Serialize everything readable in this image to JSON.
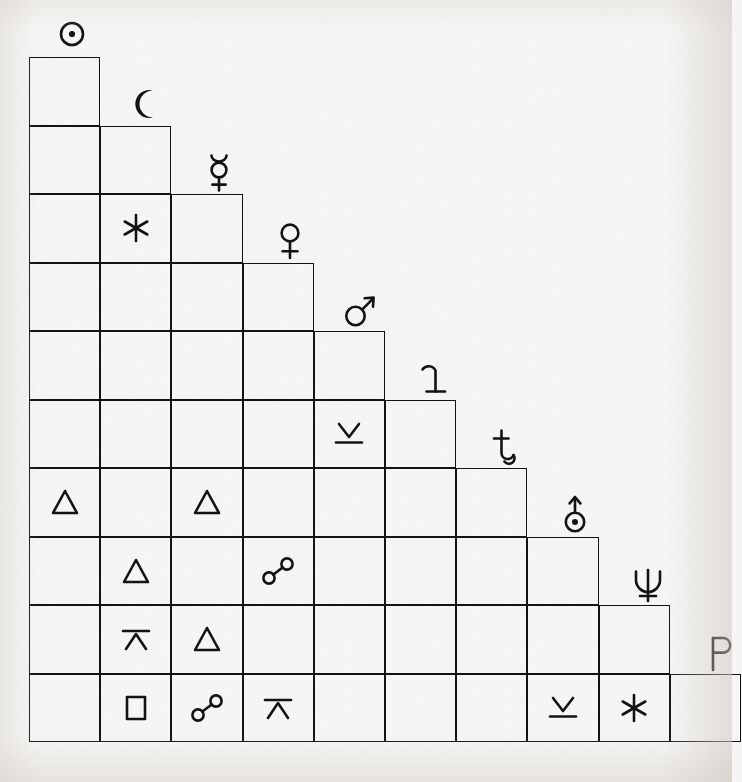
{
  "document": {
    "kind": "astrological-aspectarian",
    "title": "Aspect Grid",
    "background_color": "#f6f5f3",
    "ink_color": "#15130f"
  },
  "grid": {
    "origin_x": 29,
    "origin_y": 57,
    "cell_width": 71.2,
    "cell_height": 68.5,
    "rows": 10,
    "shape": "lower-left-triangular-staircase"
  },
  "planets": [
    {
      "index": 0,
      "name": "Sun",
      "symbol": "☉",
      "icon": "sun-icon",
      "label": "Sun"
    },
    {
      "index": 1,
      "name": "Moon",
      "symbol": "☾",
      "icon": "moon-icon",
      "label": "Moon"
    },
    {
      "index": 2,
      "name": "Mercury",
      "symbol": "☿",
      "icon": "mercury-icon",
      "label": "Mercury"
    },
    {
      "index": 3,
      "name": "Venus",
      "symbol": "♀",
      "icon": "venus-icon",
      "label": "Venus"
    },
    {
      "index": 4,
      "name": "Mars",
      "symbol": "♂",
      "icon": "mars-icon",
      "label": "Mars"
    },
    {
      "index": 5,
      "name": "Jupiter",
      "symbol": "♃",
      "icon": "jupiter-icon",
      "label": "Jupiter"
    },
    {
      "index": 6,
      "name": "Saturn",
      "symbol": "♄",
      "icon": "saturn-icon",
      "label": "Saturn"
    },
    {
      "index": 7,
      "name": "Uranus",
      "symbol": "⛢",
      "icon": "uranus-icon",
      "label": "Uranus"
    },
    {
      "index": 8,
      "name": "Neptune",
      "symbol": "♆",
      "icon": "neptune-icon",
      "label": "Neptune"
    },
    {
      "index": 9,
      "name": "Pluto",
      "symbol": "♇",
      "icon": "pluto-icon",
      "label": "Pluto"
    }
  ],
  "aspect_types": {
    "sextile": {
      "symbol": "✶",
      "icon": "sextile-icon",
      "label": "Sextile",
      "angle": 60
    },
    "trine": {
      "symbol": "△",
      "icon": "trine-icon",
      "label": "Trine",
      "angle": 120
    },
    "square": {
      "symbol": "□",
      "icon": "square-icon",
      "label": "Square",
      "angle": 90
    },
    "opposition": {
      "symbol": "☍",
      "icon": "opposition-icon",
      "label": "Opposition",
      "angle": 180
    },
    "quincunx": {
      "symbol": "⊻",
      "icon": "quincunx-icon",
      "label": "Quincunx",
      "angle": 150
    },
    "quincunx_inv": {
      "symbol": "⊼",
      "icon": "quincunx-inverted-icon",
      "label": "Quincunx (inverted)",
      "angle": 150
    }
  },
  "aspects": [
    {
      "row": 2,
      "col": 1,
      "row_planet": "Mercury",
      "col_planet": "Moon",
      "type": "sextile"
    },
    {
      "row": 5,
      "col": 4,
      "row_planet": "Jupiter",
      "col_planet": "Mars",
      "type": "quincunx"
    },
    {
      "row": 6,
      "col": 0,
      "row_planet": "Saturn",
      "col_planet": "Sun",
      "type": "trine"
    },
    {
      "row": 6,
      "col": 2,
      "row_planet": "Saturn",
      "col_planet": "Mercury",
      "type": "trine"
    },
    {
      "row": 7,
      "col": 1,
      "row_planet": "Uranus",
      "col_planet": "Moon",
      "type": "trine"
    },
    {
      "row": 7,
      "col": 3,
      "row_planet": "Uranus",
      "col_planet": "Venus",
      "type": "opposition"
    },
    {
      "row": 8,
      "col": 1,
      "row_planet": "Neptune",
      "col_planet": "Moon",
      "type": "quincunx_inv"
    },
    {
      "row": 8,
      "col": 2,
      "row_planet": "Neptune",
      "col_planet": "Mercury",
      "type": "trine"
    },
    {
      "row": 9,
      "col": 1,
      "row_planet": "Pluto",
      "col_planet": "Moon",
      "type": "square"
    },
    {
      "row": 9,
      "col": 2,
      "row_planet": "Pluto",
      "col_planet": "Mercury",
      "type": "opposition"
    },
    {
      "row": 9,
      "col": 3,
      "row_planet": "Pluto",
      "col_planet": "Venus",
      "type": "quincunx_inv"
    },
    {
      "row": 9,
      "col": 7,
      "row_planet": "Pluto",
      "col_planet": "Uranus",
      "type": "quincunx"
    },
    {
      "row": 9,
      "col": 8,
      "row_planet": "Pluto",
      "col_planet": "Neptune",
      "type": "sextile"
    }
  ]
}
